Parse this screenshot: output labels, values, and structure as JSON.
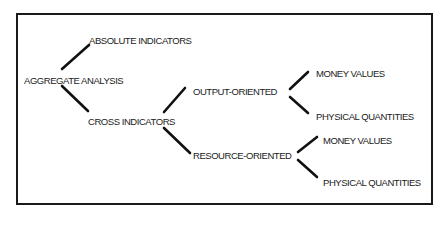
{
  "diagram": {
    "type": "tree",
    "root": {
      "label": "AGGREGATE ANALYSIS",
      "children": [
        {
          "label": "ABSOLUTE INDICATORS"
        },
        {
          "label": "CROSS INDICATORS",
          "children": [
            {
              "label": "OUTPUT-ORIENTED",
              "children": [
                {
                  "label": "MONEY VALUES"
                },
                {
                  "label": "PHYSICAL QUANTITIES"
                }
              ]
            },
            {
              "label": "RESOURCE-ORIENTED",
              "children": [
                {
                  "label": "MONEY VALUES"
                },
                {
                  "label": "PHYSICAL QUANTITIES"
                }
              ]
            }
          ]
        }
      ]
    }
  },
  "nodes": {
    "aggregate": "AGGREGATE ANALYSIS",
    "absolute": "ABSOLUTE INDICATORS",
    "cross": "CROSS INDICATORS",
    "output": "OUTPUT-ORIENTED",
    "output_money": "MONEY VALUES",
    "output_physical": "PHYSICAL QUANTITIES",
    "resource": "RESOURCE-ORIENTED",
    "resource_money": "MONEY VALUES",
    "resource_physical": "PHYSICAL QUANTITIES"
  },
  "colors": {
    "ink": "#1a1a1a",
    "background": "#ffffff"
  }
}
